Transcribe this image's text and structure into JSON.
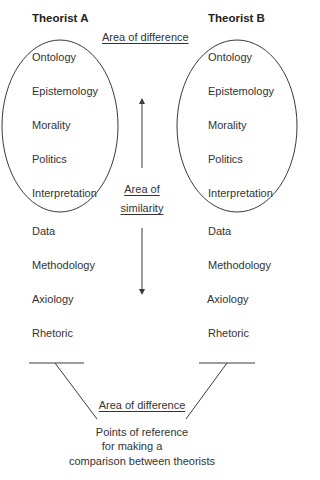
{
  "diagram": {
    "theorist_a": {
      "title": "Theorist A",
      "items": [
        "Ontology",
        "Epistemology",
        "Morality",
        "Politics",
        "Interpretation",
        "Data",
        "Methodology",
        "Axiology",
        "Rhetoric"
      ]
    },
    "theorist_b": {
      "title": "Theorist B",
      "items": [
        "Ontology",
        "Epistemology",
        "Morality",
        "Politics",
        "Interpretation",
        "Data",
        "Methodology",
        "Axiology",
        "Rhetoric"
      ]
    },
    "top_label": "Area of difference",
    "middle_label": {
      "line1": "Area of",
      "line2": "similarity"
    },
    "bottom_label": "Area of difference",
    "caption": {
      "line1": "Points of reference",
      "line2": "for making a",
      "line3": "comparison between theorists"
    },
    "colors": {
      "line": "#3a3a3a",
      "text": "#333333",
      "background": "#ffffff"
    }
  }
}
